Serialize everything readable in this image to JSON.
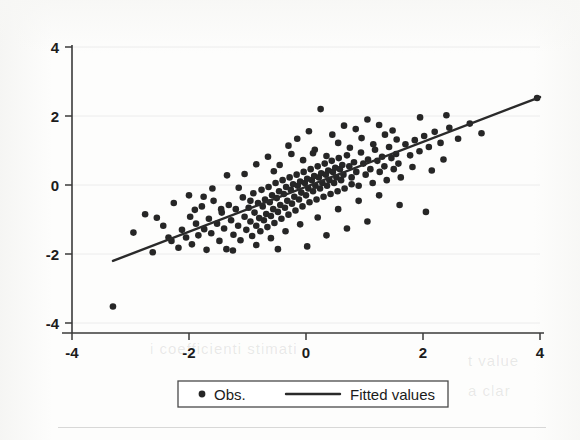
{
  "figure": {
    "background_color": "#fdfdfc",
    "ink_color": "#262626"
  },
  "legend": {
    "obs_label": "Obs.",
    "fit_label": "Fitted values",
    "marker_obs": "filled-circle",
    "marker_fit": "solid-line"
  },
  "ghost_artifacts": [
    {
      "text": "i coefficienti stimati",
      "x": 150,
      "y": 350
    },
    {
      "text": "t value",
      "x": 470,
      "y": 362
    },
    {
      "text": "a clar",
      "x": 470,
      "y": 392
    }
  ],
  "chart_data": {
    "type": "scatter",
    "title": "",
    "xlabel": "",
    "ylabel": "",
    "xlim": [
      -4,
      4
    ],
    "ylim": [
      -4,
      4
    ],
    "xticks": [
      -4,
      -2,
      0,
      2,
      4
    ],
    "yticks": [
      -4,
      -2,
      0,
      2,
      4
    ],
    "xtick_labels": [
      "-4",
      "-2",
      "0",
      "2",
      "4"
    ],
    "ytick_labels": [
      "-4",
      "-2",
      "0",
      "2",
      "4"
    ],
    "grid": "horizontal-faint",
    "legend_position": "below-axes",
    "series": [
      {
        "name": "Obs.",
        "type": "scatter",
        "marker": "circle",
        "color": "#262626",
        "points": [
          [
            -3.3,
            -3.52
          ],
          [
            -2.95,
            -1.38
          ],
          [
            -2.62,
            -1.95
          ],
          [
            -2.44,
            -1.18
          ],
          [
            -2.3,
            -1.62
          ],
          [
            -2.26,
            -0.52
          ],
          [
            -2.18,
            -1.82
          ],
          [
            -2.12,
            -1.3
          ],
          [
            -2.05,
            -1.52
          ],
          [
            -1.98,
            -0.92
          ],
          [
            -1.95,
            -1.72
          ],
          [
            -1.88,
            -1.12
          ],
          [
            -1.84,
            -1.46
          ],
          [
            -1.78,
            -0.62
          ],
          [
            -1.74,
            -1.28
          ],
          [
            -1.7,
            -1.88
          ],
          [
            -1.66,
            -0.98
          ],
          [
            -1.62,
            -1.4
          ],
          [
            -1.58,
            -0.46
          ],
          [
            -1.52,
            -1.12
          ],
          [
            -1.48,
            -1.62
          ],
          [
            -1.44,
            -0.8
          ],
          [
            -1.4,
            -1.26
          ],
          [
            -1.36,
            -1.86
          ],
          [
            -1.32,
            -0.58
          ],
          [
            -1.28,
            -1.02
          ],
          [
            -1.24,
            -1.44
          ],
          [
            -1.2,
            -0.7
          ],
          [
            -1.16,
            -1.18
          ],
          [
            -1.12,
            -1.6
          ],
          [
            -1.08,
            -0.36
          ],
          [
            -1.05,
            -0.92
          ],
          [
            -1.02,
            -1.3
          ],
          [
            -0.98,
            -0.66
          ],
          [
            -0.95,
            -1.06
          ],
          [
            -0.92,
            -1.48
          ],
          [
            -0.9,
            -0.24
          ],
          [
            -0.88,
            -0.8
          ],
          [
            -0.85,
            -1.18
          ],
          [
            -0.82,
            -0.52
          ],
          [
            -0.8,
            -0.96
          ],
          [
            -0.78,
            -1.34
          ],
          [
            -0.76,
            -0.14
          ],
          [
            -0.74,
            -0.62
          ],
          [
            -0.72,
            -1.02
          ],
          [
            -0.7,
            -0.42
          ],
          [
            -0.68,
            -0.84
          ],
          [
            -0.66,
            -1.22
          ],
          [
            -0.64,
            -0.06
          ],
          [
            -0.62,
            -0.5
          ],
          [
            -0.6,
            -0.9
          ],
          [
            -0.58,
            -0.3
          ],
          [
            -0.56,
            -0.7
          ],
          [
            -0.54,
            -1.1
          ],
          [
            -0.52,
            0.06
          ],
          [
            -0.5,
            -0.38
          ],
          [
            -0.48,
            -0.78
          ],
          [
            -0.46,
            -0.18
          ],
          [
            -0.44,
            -0.58
          ],
          [
            -0.42,
            -0.98
          ],
          [
            -0.4,
            0.14
          ],
          [
            -0.38,
            -0.26
          ],
          [
            -0.36,
            -0.66
          ],
          [
            -0.34,
            -0.06
          ],
          [
            -0.32,
            -0.46
          ],
          [
            -0.3,
            -0.86
          ],
          [
            -0.28,
            0.22
          ],
          [
            -0.26,
            -0.14
          ],
          [
            -0.24,
            -0.54
          ],
          [
            -0.22,
            0.02
          ],
          [
            -0.2,
            -0.34
          ],
          [
            -0.18,
            -0.74
          ],
          [
            -0.16,
            0.3
          ],
          [
            -0.14,
            -0.02
          ],
          [
            -0.12,
            -0.42
          ],
          [
            -0.1,
            0.1
          ],
          [
            -0.08,
            -0.22
          ],
          [
            -0.06,
            -0.62
          ],
          [
            -0.04,
            0.38
          ],
          [
            -0.02,
            0.06
          ],
          [
            0.0,
            -0.3
          ],
          [
            0.02,
            0.18
          ],
          [
            0.04,
            -0.1
          ],
          [
            0.06,
            -0.5
          ],
          [
            0.08,
            0.46
          ],
          [
            0.1,
            0.14
          ],
          [
            0.12,
            -0.18
          ],
          [
            0.14,
            0.26
          ],
          [
            0.16,
            -0.02
          ],
          [
            0.18,
            -0.42
          ],
          [
            0.2,
            0.54
          ],
          [
            0.22,
            0.22
          ],
          [
            0.24,
            -0.1
          ],
          [
            0.26,
            0.34
          ],
          [
            0.28,
            0.06
          ],
          [
            0.3,
            -0.34
          ],
          [
            0.32,
            0.62
          ],
          [
            0.34,
            0.3
          ],
          [
            0.36,
            -0.02
          ],
          [
            0.38,
            0.42
          ],
          [
            0.4,
            0.14
          ],
          [
            0.42,
            -0.26
          ],
          [
            0.44,
            0.7
          ],
          [
            0.46,
            0.38
          ],
          [
            0.48,
            0.06
          ],
          [
            0.5,
            0.5
          ],
          [
            0.52,
            0.22
          ],
          [
            0.54,
            -0.18
          ],
          [
            0.56,
            0.78
          ],
          [
            0.58,
            0.46
          ],
          [
            0.6,
            0.14
          ],
          [
            0.62,
            0.58
          ],
          [
            0.64,
            0.3
          ],
          [
            0.66,
            -0.1
          ],
          [
            0.7,
            0.86
          ],
          [
            0.74,
            0.54
          ],
          [
            0.78,
            0.22
          ],
          [
            0.82,
            0.66
          ],
          [
            0.86,
            0.38
          ],
          [
            0.9,
            -0.02
          ],
          [
            0.94,
            0.94
          ],
          [
            0.98,
            0.62
          ],
          [
            1.02,
            0.3
          ],
          [
            1.06,
            0.74
          ],
          [
            1.1,
            0.46
          ],
          [
            1.14,
            0.06
          ],
          [
            1.18,
            1.02
          ],
          [
            1.22,
            0.7
          ],
          [
            1.26,
            0.38
          ],
          [
            1.3,
            0.82
          ],
          [
            1.34,
            0.54
          ],
          [
            1.38,
            0.14
          ],
          [
            1.42,
            1.1
          ],
          [
            1.46,
            0.78
          ],
          [
            1.5,
            0.46
          ],
          [
            1.54,
            0.9
          ],
          [
            1.58,
            0.62
          ],
          [
            1.62,
            0.22
          ],
          [
            1.7,
            1.18
          ],
          [
            1.78,
            0.86
          ],
          [
            1.86,
            1.3
          ],
          [
            1.94,
            0.98
          ],
          [
            2.02,
            1.42
          ],
          [
            2.1,
            1.1
          ],
          [
            2.2,
            1.54
          ],
          [
            2.3,
            1.22
          ],
          [
            2.45,
            1.66
          ],
          [
            2.6,
            1.34
          ],
          [
            2.8,
            1.78
          ],
          [
            3.95,
            2.52
          ],
          [
            -2.55,
            -0.95
          ],
          [
            -2.0,
            -0.3
          ],
          [
            -1.6,
            -0.1
          ],
          [
            -1.35,
            0.28
          ],
          [
            -1.05,
            0.32
          ],
          [
            -0.85,
            0.6
          ],
          [
            -0.65,
            0.82
          ],
          [
            -0.45,
            0.58
          ],
          [
            -0.25,
            0.9
          ],
          [
            -0.05,
            0.72
          ],
          [
            0.15,
            1.02
          ],
          [
            0.35,
            0.84
          ],
          [
            0.55,
            1.22
          ],
          [
            0.75,
            1.08
          ],
          [
            0.95,
            1.36
          ],
          [
            1.15,
            1.18
          ],
          [
            1.35,
            1.46
          ],
          [
            1.55,
            1.32
          ],
          [
            0.05,
            1.56
          ],
          [
            0.45,
            1.46
          ],
          [
            0.85,
            1.62
          ],
          [
            1.25,
            1.74
          ],
          [
            1.95,
            1.96
          ],
          [
            2.4,
            2.02
          ],
          [
            0.25,
            2.2
          ],
          [
            1.05,
            1.9
          ],
          [
            -0.15,
            1.34
          ],
          [
            0.65,
            1.72
          ],
          [
            -0.55,
            0.4
          ],
          [
            -1.15,
            -0.08
          ],
          [
            -1.75,
            -0.34
          ],
          [
            0.9,
            -0.46
          ],
          [
            1.25,
            -0.3
          ],
          [
            1.6,
            -0.58
          ],
          [
            0.55,
            -0.7
          ],
          [
            0.2,
            -0.94
          ],
          [
            -0.1,
            -1.14
          ],
          [
            -0.35,
            -1.34
          ],
          [
            -0.6,
            -1.54
          ],
          [
            0.35,
            -1.46
          ],
          [
            0.7,
            -1.26
          ],
          [
            1.05,
            -1.06
          ],
          [
            -0.85,
            -1.74
          ],
          [
            -1.25,
            -1.9
          ],
          [
            2.05,
            -0.78
          ],
          [
            2.35,
            0.74
          ],
          [
            3.0,
            1.5
          ],
          [
            -2.75,
            -0.85
          ],
          [
            -1.45,
            -0.7
          ],
          [
            -0.95,
            -0.46
          ],
          [
            0.12,
            0.92
          ],
          [
            1.48,
            1.58
          ],
          [
            -0.3,
            1.14
          ],
          [
            0.78,
            0.02
          ],
          [
            -1.9,
            -0.72
          ],
          [
            -2.35,
            -1.52
          ],
          [
            1.82,
            0.52
          ],
          [
            2.15,
            0.42
          ],
          [
            -0.48,
            -1.86
          ],
          [
            0.02,
            -1.78
          ]
        ]
      },
      {
        "name": "Fitted values",
        "type": "line",
        "color": "#2a2a2a",
        "x_range": [
          -3.3,
          4.0
        ],
        "y_range": [
          -2.2,
          2.55
        ],
        "slope": 0.651,
        "intercept": -0.052
      }
    ]
  }
}
